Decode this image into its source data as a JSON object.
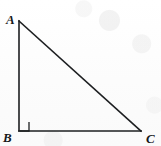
{
  "figure": {
    "background_color": "#fdfdfd",
    "stroke_color": "#1d1f21",
    "stroke_width": 1.6,
    "labels": {
      "a": "A",
      "b": "B",
      "c": "C"
    },
    "vertices": {
      "a": {
        "x": 19,
        "y": 21
      },
      "b": {
        "x": 19,
        "y": 131
      },
      "c": {
        "x": 141,
        "y": 131
      }
    },
    "right_angle_marker": {
      "at_vertex": "B",
      "size": 9,
      "points": "29,122 29,131 20,131"
    },
    "edges": [
      {
        "name": "leg-AB",
        "from": "A",
        "to": "B",
        "path": "M 19 21 L 19 131"
      },
      {
        "name": "leg-BC",
        "from": "B",
        "to": "C",
        "path": "M 19 131 L 141 131"
      },
      {
        "name": "hypotenuse-AC",
        "from": "A",
        "to": "C",
        "path": "M 19 21 L 141 131"
      }
    ]
  }
}
